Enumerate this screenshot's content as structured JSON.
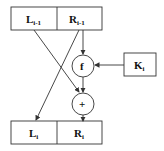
{
  "diagram": {
    "top_block": {
      "left": "L",
      "left_sub": "i-1",
      "right": "R",
      "right_sub": "i-1"
    },
    "bottom_block": {
      "left": "L",
      "left_sub": "i",
      "right": "R",
      "right_sub": "i"
    },
    "round_function": "f",
    "xor_op": "+",
    "key": {
      "label": "K",
      "sub": "i"
    },
    "colors": {
      "stroke": "#333333",
      "text": "#111111",
      "background": "#ffffff"
    }
  }
}
